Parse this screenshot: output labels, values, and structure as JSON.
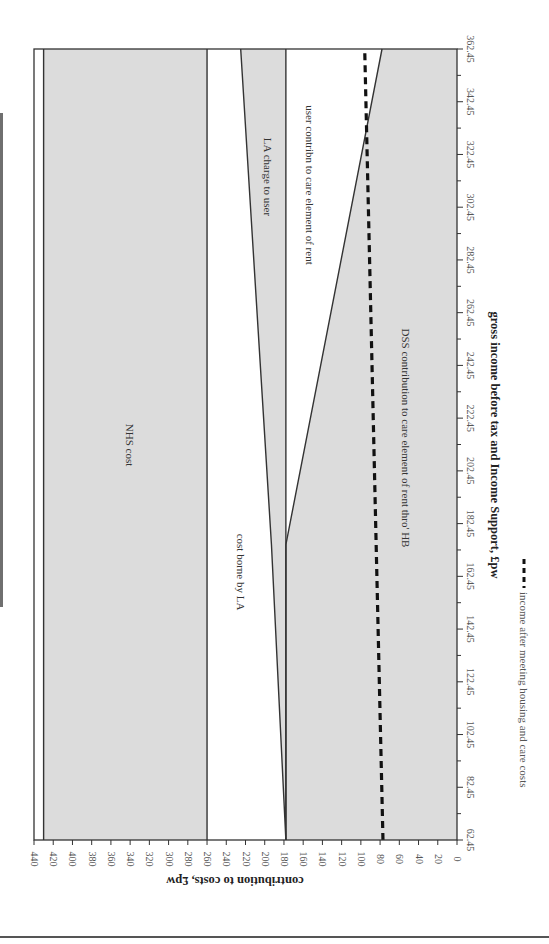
{
  "chart_data": {
    "type": "area",
    "orientation": "rotated 90deg clockwise (x-axis runs vertically on the right, y-axis along the bottom, text reads top-to-bottom)",
    "title": "",
    "xlabel": "gross income before tax and Income Support, £pw",
    "ylabel": "contribution to costs, £pw",
    "xlim": [
      62.45,
      362.45
    ],
    "ylim": [
      0,
      440
    ],
    "x_ticks": [
      "62.45",
      "82.45",
      "102.45",
      "122.45",
      "142.45",
      "162.45",
      "182.45",
      "202.45",
      "222.45",
      "242.45",
      "262.45",
      "282.45",
      "302.45",
      "322.45",
      "342.45",
      "362.45"
    ],
    "y_ticks": [
      "0",
      "20",
      "40",
      "60",
      "80",
      "100",
      "120",
      "140",
      "160",
      "180",
      "200",
      "220",
      "240",
      "260",
      "280",
      "300",
      "320",
      "340",
      "360",
      "380",
      "400",
      "420",
      "440"
    ],
    "grid": false,
    "x": [
      62.45,
      174.45,
      362.45
    ],
    "series": [
      {
        "name": "DSS contribution to care element of rent thro' HB",
        "fill": "grey",
        "lower": [
          0,
          0,
          0
        ],
        "upper": [
          178,
          178,
          78
        ]
      },
      {
        "name": "user contribn to care element of rent",
        "fill": "white",
        "lower": [
          178,
          178,
          78
        ],
        "upper": [
          178,
          178,
          178
        ]
      },
      {
        "name": "LA charge to user",
        "fill": "grey",
        "lower": [
          178,
          178,
          178
        ],
        "upper": [
          178,
          193,
          225
        ]
      },
      {
        "name": "cost borne by LA",
        "fill": "white",
        "lower": [
          178,
          193,
          225
        ],
        "upper": [
          260,
          260,
          260
        ]
      },
      {
        "name": "NHS cost",
        "fill": "grey",
        "lower": [
          260,
          260,
          260
        ],
        "upper": [
          430,
          430,
          430
        ]
      }
    ],
    "lines": [
      {
        "name": "income after meeting housing and care costs",
        "style": "dashed",
        "x": [
          62.45,
          362.45
        ],
        "y": [
          77,
          96
        ]
      }
    ],
    "band_labels": [
      {
        "text": "NHS cost",
        "x": 222,
        "y": 345
      },
      {
        "text": "cost borne by LA",
        "x": 160,
        "y": 220
      },
      {
        "text": "LA charge to user",
        "x": 320,
        "y": 200
      },
      {
        "text": "user contribn to care element of rent",
        "x": 300,
        "y": 140
      },
      {
        "text": "DSS contribution to care element of rent thro' HB",
        "x": 200,
        "y": 60
      }
    ],
    "legend": {
      "position": "bottom (rotated, right side)",
      "entries": [
        {
          "label": "income after meeting housing and care costs",
          "style": "dashed black"
        }
      ]
    }
  },
  "labels": {
    "nhs": "NHS cost",
    "la_cost": "cost borne by LA",
    "la_charge": "LA charge to user",
    "user_contrib": "user contribn to care element of rent",
    "dss": "DSS contribution to care element of rent thro' HB",
    "xlabel": "gross income before tax and Income Support, £pw",
    "ylabel": "contribution to costs, £pw",
    "legend": "income after meeting housing and care costs"
  },
  "colors": {
    "band_grey": "#dcdcdc",
    "line": "#333333",
    "dash": "#111111",
    "side_bar": "#6f6f6f"
  }
}
